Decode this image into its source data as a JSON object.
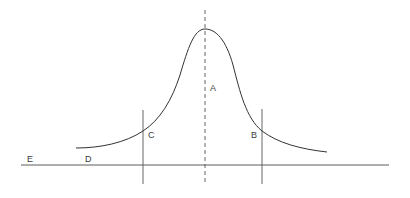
{
  "diagram": {
    "type": "bell-curve",
    "labels": {
      "a": "A",
      "b": "B",
      "c": "C",
      "d": "D",
      "e": "E"
    },
    "colors": {
      "line": "#3c3c3c",
      "curve": "#333333",
      "background": "#ffffff"
    }
  }
}
